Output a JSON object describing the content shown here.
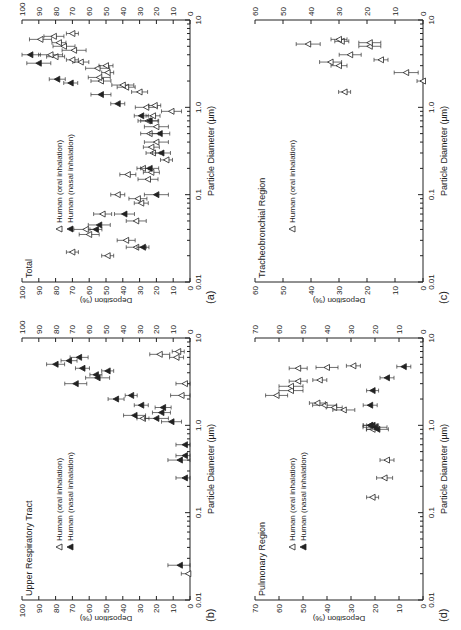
{
  "figure": {
    "panels": [
      {
        "id": "a",
        "label": "(a)",
        "title": "Total",
        "legend": [
          "Human (oral inhalation)",
          "Human (nasal inhalation)"
        ]
      },
      {
        "id": "b",
        "label": "(b)",
        "title": "Upper Respiratory Tract",
        "legend": [
          "Human (oral inhalation)",
          "Human (nasal inhalation)"
        ]
      },
      {
        "id": "c",
        "label": "(c)",
        "title": "Tracheobronchial Region",
        "legend": [
          "Human (oral inhalation)"
        ]
      },
      {
        "id": "d",
        "label": "(d)",
        "title": "Pulmonary Region",
        "legend": [
          "Human (oral inhalation)",
          "Human (nasal inhalation)"
        ]
      }
    ],
    "xlabel": "Particle Diameter (µm)",
    "ylabel": "Deposition (%)"
  },
  "chart_data": [
    {
      "panel": "a",
      "type": "scatter",
      "title": "Total",
      "xlabel": "Particle Diameter (µm)",
      "ylabel": "Deposition (%)",
      "xscale": "log",
      "xlim": [
        0.01,
        10
      ],
      "ylim": [
        0,
        100
      ],
      "xticks": [
        "0.01",
        "0.1",
        "1.0",
        "10"
      ],
      "yticks": [
        0,
        10,
        20,
        30,
        40,
        50,
        60,
        70,
        80,
        90,
        100
      ],
      "series": [
        {
          "name": "Human (oral inhalation)",
          "marker": "open-triangle",
          "points": [
            [
              0.006,
              84
            ],
            [
              0.007,
              82
            ],
            [
              0.008,
              80
            ],
            [
              0.02,
              49
            ],
            [
              0.022,
              70
            ],
            [
              0.025,
              32
            ],
            [
              0.03,
              38
            ],
            [
              0.035,
              60
            ],
            [
              0.04,
              62
            ],
            [
              0.05,
              32
            ],
            [
              0.06,
              52
            ],
            [
              0.08,
              29
            ],
            [
              0.09,
              31
            ],
            [
              0.1,
              43
            ],
            [
              0.15,
              25
            ],
            [
              0.17,
              37
            ],
            [
              0.18,
              23
            ],
            [
              0.2,
              28
            ],
            [
              0.25,
              14
            ],
            [
              0.3,
              22
            ],
            [
              0.35,
              23
            ],
            [
              0.4,
              20
            ],
            [
              0.5,
              24
            ],
            [
              0.6,
              20
            ],
            [
              0.7,
              25
            ],
            [
              0.8,
              22
            ],
            [
              0.9,
              11
            ],
            [
              1.0,
              26
            ],
            [
              1.05,
              21
            ],
            [
              1.5,
              30
            ],
            [
              1.7,
              38
            ],
            [
              1.8,
              40
            ],
            [
              2,
              53
            ],
            [
              2.2,
              54
            ],
            [
              2.5,
              49
            ],
            [
              2.8,
              55
            ],
            [
              3,
              50
            ],
            [
              3.3,
              65
            ],
            [
              3.5,
              70
            ],
            [
              3.8,
              80
            ],
            [
              4,
              83
            ],
            [
              4.5,
              69
            ],
            [
              5,
              75
            ],
            [
              5.5,
              78
            ],
            [
              6,
              89
            ],
            [
              6.5,
              81
            ],
            [
              7,
              70
            ]
          ]
        },
        {
          "name": "Human (nasal inhalation)",
          "marker": "filled-triangle",
          "points": [
            [
              0.025,
              28
            ],
            [
              0.04,
              56
            ],
            [
              0.045,
              54
            ],
            [
              0.06,
              39
            ],
            [
              0.1,
              20
            ],
            [
              0.2,
              24
            ],
            [
              0.3,
              17
            ],
            [
              0.5,
              18
            ],
            [
              0.7,
              24
            ],
            [
              0.8,
              29
            ],
            [
              1.1,
              43
            ],
            [
              1.4,
              53
            ],
            [
              1.9,
              71
            ],
            [
              2.1,
              79
            ],
            [
              3.2,
              90
            ],
            [
              4,
              95
            ]
          ]
        }
      ]
    },
    {
      "panel": "b",
      "type": "scatter",
      "title": "Upper Respiratory Tract",
      "xlabel": "Particle Diameter (µm)",
      "ylabel": "Deposition (%)",
      "xscale": "log",
      "xlim": [
        0.01,
        10
      ],
      "ylim": [
        0,
        100
      ],
      "xticks": [
        "0.01",
        "0.1",
        "1.0",
        "10"
      ],
      "yticks": [
        0,
        10,
        20,
        30,
        40,
        50,
        60,
        70,
        80,
        90,
        100
      ],
      "series": [
        {
          "name": "Human (oral inhalation)",
          "marker": "open-triangle",
          "points": [
            [
              0.02,
              1
            ],
            [
              1.2,
              28
            ],
            [
              2.2,
              5
            ],
            [
              3,
              3
            ],
            [
              6,
              8
            ],
            [
              6.5,
              18
            ],
            [
              7,
              7
            ]
          ]
        },
        {
          "name": "Human (nasal inhalation)",
          "marker": "filled-triangle",
          "points": [
            [
              0.025,
              6
            ],
            [
              0.25,
              3
            ],
            [
              0.4,
              6
            ],
            [
              0.45,
              3
            ],
            [
              0.6,
              3
            ],
            [
              1.1,
              11
            ],
            [
              1.2,
              20
            ],
            [
              1.3,
              33
            ],
            [
              1.4,
              17
            ],
            [
              1.6,
              16
            ],
            [
              1.7,
              29
            ],
            [
              2,
              44
            ],
            [
              2.2,
              35
            ],
            [
              3,
              68
            ],
            [
              3.5,
              55
            ],
            [
              3.8,
              56
            ],
            [
              4.2,
              49
            ],
            [
              4.5,
              64
            ],
            [
              5,
              80
            ],
            [
              5.5,
              72
            ],
            [
              6,
              66
            ]
          ]
        }
      ]
    },
    {
      "panel": "c",
      "type": "scatter",
      "title": "Tracheobronchial Region",
      "xlabel": "Particle Diameter (µm)",
      "ylabel": "Deposition (%)",
      "xscale": "log",
      "xlim": [
        0.01,
        10
      ],
      "ylim": [
        0,
        60
      ],
      "xticks": [
        "0.01",
        "0.1",
        "1.0",
        "10"
      ],
      "yticks": [
        0,
        10,
        20,
        30,
        40,
        50,
        60
      ],
      "series": [
        {
          "name": "Human (oral inhalation)",
          "marker": "open-triangle",
          "points": [
            [
              1.5,
              28
            ],
            [
              2,
              0
            ],
            [
              2.5,
              6
            ],
            [
              3,
              30
            ],
            [
              3.3,
              33
            ],
            [
              3.5,
              15
            ],
            [
              4,
              26
            ],
            [
              5,
              19
            ],
            [
              5.3,
              41
            ],
            [
              5.5,
              19
            ],
            [
              5.7,
              29
            ],
            [
              6,
              30
            ]
          ]
        }
      ]
    },
    {
      "panel": "d",
      "type": "scatter",
      "title": "Pulmonary Region",
      "xlabel": "Particle Diameter (µm)",
      "ylabel": "Deposition (%)",
      "xscale": "log",
      "xlim": [
        0.01,
        10
      ],
      "ylim": [
        0,
        70
      ],
      "xticks": [
        "0.01",
        "0.1",
        "1.0",
        "10"
      ],
      "yticks": [
        0,
        10,
        20,
        30,
        40,
        50,
        60,
        70
      ],
      "series": [
        {
          "name": "Human (oral inhalation)",
          "marker": "open-triangle",
          "points": [
            [
              0.15,
              21
            ],
            [
              0.25,
              16
            ],
            [
              0.4,
              15
            ],
            [
              0.9,
              21
            ],
            [
              1.0,
              22
            ],
            [
              1.5,
              33
            ],
            [
              1.6,
              37
            ],
            [
              1.7,
              41
            ],
            [
              1.8,
              44
            ],
            [
              2.2,
              61
            ],
            [
              2.5,
              55
            ],
            [
              2.8,
              55
            ],
            [
              3.2,
              52
            ],
            [
              3.3,
              43
            ],
            [
              4.5,
              52
            ],
            [
              4.6,
              40
            ],
            [
              4.8,
              29
            ]
          ]
        },
        {
          "name": "Human (nasal inhalation)",
          "marker": "filled-triangle",
          "points": [
            [
              0.9,
              19
            ],
            [
              0.95,
              20
            ],
            [
              1.0,
              21
            ],
            [
              1.0,
              22
            ],
            [
              1.7,
              22
            ],
            [
              2.5,
              21
            ],
            [
              3.5,
              15
            ],
            [
              4.7,
              8
            ]
          ]
        }
      ]
    }
  ]
}
